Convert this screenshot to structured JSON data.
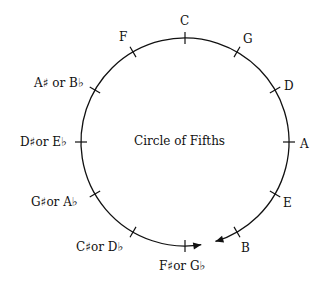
{
  "diagram": {
    "title": "Circle of Fifths",
    "center": [
      185,
      142
    ],
    "radius": 104,
    "notes": [
      {
        "label": "C",
        "angle": 0
      },
      {
        "label": "G",
        "angle": 30
      },
      {
        "label": "D",
        "angle": 60
      },
      {
        "label": "A",
        "angle": 90
      },
      {
        "label": "E",
        "angle": 120
      },
      {
        "label": "B",
        "angle": 150
      },
      {
        "label": "F♯or G♭",
        "angle": 180
      },
      {
        "label": "C♯or D♭",
        "angle": 210
      },
      {
        "label": "G♯or A♭",
        "angle": 240
      },
      {
        "label": "D♯or E♭",
        "angle": 270
      },
      {
        "label": "A♯ or B♭",
        "angle": 300
      },
      {
        "label": "F",
        "angle": 330
      }
    ],
    "arrows": "two arrowheads meeting at bottom gap between F♯/G♭ and B"
  }
}
